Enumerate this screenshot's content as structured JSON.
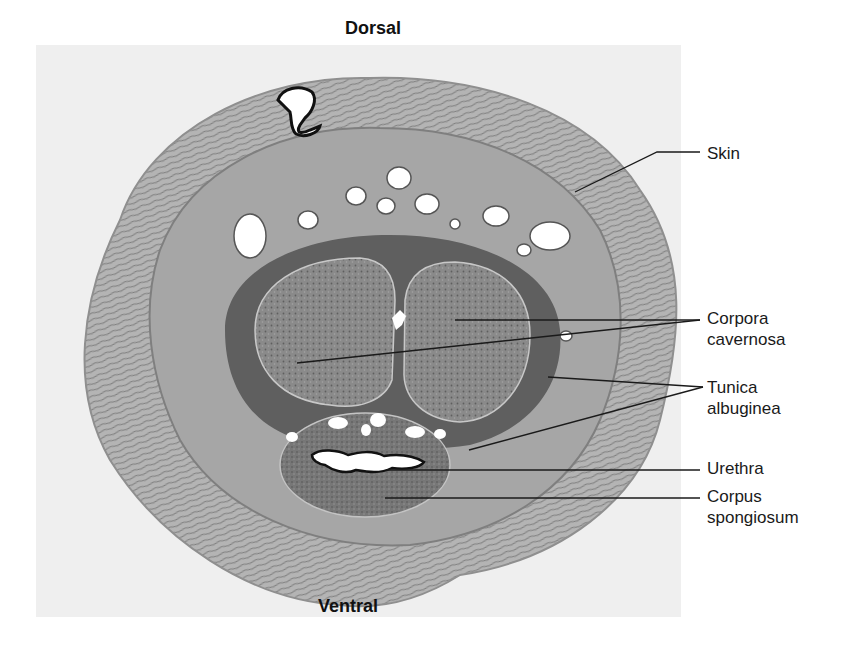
{
  "figure": {
    "orientation": {
      "top": "Dorsal",
      "bottom": "Ventral"
    },
    "labels": [
      {
        "id": "skin",
        "lines": [
          "Skin"
        ],
        "x": 707,
        "y": 143
      },
      {
        "id": "corpora-cavernosa",
        "lines": [
          "Corpora",
          "cavernosa"
        ],
        "x": 707,
        "y": 308
      },
      {
        "id": "tunica-albuginea",
        "lines": [
          "Tunica",
          "albuginea"
        ],
        "x": 707,
        "y": 381
      },
      {
        "id": "urethra",
        "lines": [
          "Urethra"
        ],
        "x": 707,
        "y": 458
      },
      {
        "id": "corpus-spongiosum",
        "lines": [
          "Corpus",
          "spongiosum"
        ],
        "x": 707,
        "y": 486
      }
    ],
    "leader_lines": [
      {
        "for": "skin",
        "points": [
          [
            700,
            152
          ],
          [
            657,
            152
          ],
          [
            575,
            192
          ]
        ]
      },
      {
        "for": "corpora-cavernosa",
        "points": [
          [
            700,
            320
          ],
          [
            455,
            320
          ]
        ]
      },
      {
        "for": "corpora-cavernosa",
        "points": [
          [
            700,
            320
          ],
          [
            297,
            363
          ]
        ]
      },
      {
        "for": "tunica-albuginea",
        "points": [
          [
            703,
            387
          ],
          [
            548,
            377
          ]
        ]
      },
      {
        "for": "tunica-albuginea",
        "points": [
          [
            703,
            387
          ],
          [
            469,
            450
          ]
        ]
      },
      {
        "for": "urethra",
        "points": [
          [
            700,
            470
          ],
          [
            386,
            470
          ]
        ]
      },
      {
        "for": "corpus-spongiosum",
        "points": [
          [
            700,
            498
          ],
          [
            385,
            498
          ]
        ]
      }
    ],
    "colors": {
      "background": "#ffffff",
      "slide": "#efefef",
      "skin_outer": "#c9c9c9",
      "dermis": "#9a9a9a",
      "tunica": "#5e5e5e",
      "cavernosa": "#858585",
      "spongiosum": "#7a7a7a",
      "lumen": "#ffffff",
      "line": "#1a1a1a"
    }
  }
}
